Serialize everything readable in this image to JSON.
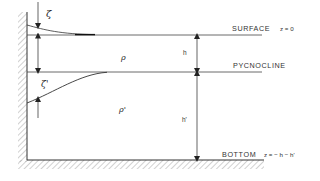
{
  "diagram": {
    "labels": {
      "surface": "SURFACE",
      "surface_eq": "z = 0",
      "pycnocline": "PYCNOCLINE",
      "bottom": "BOTTOM",
      "bottom_eq": "z = − h − h'",
      "upper_density": "ρ",
      "lower_density": "ρ'",
      "upper_depth": "h",
      "lower_depth": "h'",
      "surface_displacement": "ζ",
      "pycnocline_displacement": "ζ'"
    },
    "colors": {
      "ink": "#333333",
      "hatch": "#9a9a9a"
    }
  }
}
